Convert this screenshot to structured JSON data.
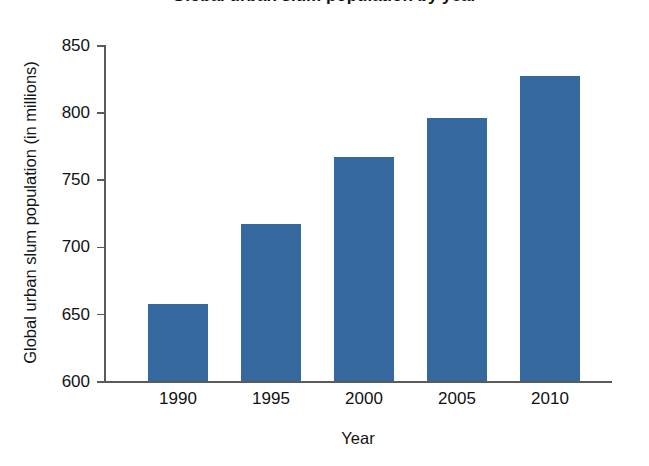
{
  "chart_data": {
    "type": "bar",
    "title": "Global urban slum population by year",
    "categories": [
      "1990",
      "1995",
      "2000",
      "2005",
      "2010"
    ],
    "values": [
      657,
      717,
      767,
      796,
      827
    ],
    "xlabel": "Year",
    "ylabel": "Global urban slum population (in millions)",
    "ylim": [
      600,
      850
    ],
    "ytick_labels": [
      "850",
      "800",
      "750",
      "700",
      "650",
      "600"
    ],
    "ytick_values": [
      850,
      800,
      750,
      700,
      650,
      600
    ],
    "ystep": 50,
    "grid": false,
    "legend": "none",
    "series": [
      {
        "name": "Global urban slum population (in millions)",
        "values": [
          657,
          717,
          767,
          796,
          827
        ]
      }
    ]
  },
  "colors": {
    "bar": "#35689E",
    "axis": "#5a5a5a",
    "text": "#111111",
    "background": "#ffffff"
  }
}
